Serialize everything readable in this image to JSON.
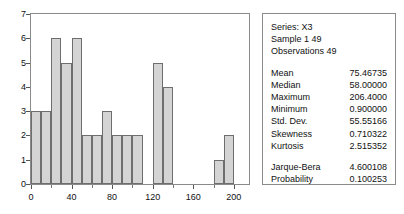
{
  "chart_data": {
    "type": "bar",
    "title": "",
    "xlabel": "",
    "ylabel": "",
    "bin_width": 10,
    "bin_starts": [
      0,
      10,
      20,
      30,
      40,
      50,
      60,
      70,
      80,
      90,
      100,
      110,
      120,
      130,
      140,
      150,
      160,
      170,
      180,
      190,
      200
    ],
    "values": [
      3,
      3,
      6,
      5,
      6,
      2,
      2,
      3,
      2,
      2,
      2,
      0,
      5,
      4,
      0,
      0,
      0,
      0,
      1,
      2,
      0
    ],
    "categories": [
      "0",
      "10",
      "20",
      "30",
      "40",
      "50",
      "60",
      "70",
      "80",
      "90",
      "100",
      "110",
      "120",
      "130",
      "140",
      "150",
      "160",
      "170",
      "180",
      "190",
      "200"
    ],
    "xlim": [
      0,
      215
    ],
    "ylim": [
      0,
      7
    ],
    "y_ticks": [
      0,
      1,
      2,
      3,
      4,
      5,
      6,
      7
    ],
    "x_ticks": [
      0,
      40,
      80,
      120,
      160,
      200
    ],
    "x_minor_ticks": [
      20,
      60,
      100,
      140,
      180
    ],
    "grid": false,
    "legend": "none",
    "bar_fill": "#d4d4d4",
    "bar_border": "#6e6e6e"
  },
  "stats": {
    "series_line": "Series: X3",
    "sample_line": "Sample 1 49",
    "observations_line": "Observations 49",
    "rows": [
      {
        "key": "Mean",
        "value": "75.46735"
      },
      {
        "key": "Median",
        "value": "58.00000"
      },
      {
        "key": "Maximum",
        "value": "206.4000"
      },
      {
        "key": "Minimum",
        "value": "0.900000"
      },
      {
        "key": "Std. Dev.",
        "value": "55.55166"
      },
      {
        "key": "Skewness",
        "value": "0.710322"
      },
      {
        "key": "Kurtosis",
        "value": "2.515352"
      }
    ],
    "test_rows": [
      {
        "key": "Jarque-Bera",
        "value": "4.600108"
      },
      {
        "key": "Probability",
        "value": "0.100253"
      }
    ]
  }
}
